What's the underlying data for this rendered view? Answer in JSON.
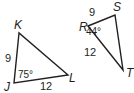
{
  "diagram": {
    "line_color": "#231f20",
    "triangles": [
      {
        "name": "JKL",
        "vertices": {
          "K": {
            "label": "K",
            "x": 19,
            "y": 33
          },
          "J": {
            "label": "J",
            "x": 14,
            "y": 83
          },
          "L": {
            "label": "L",
            "x": 68,
            "y": 75
          }
        },
        "sides": {
          "JK": "9",
          "JL": "12"
        },
        "angle": {
          "vertex": "J",
          "value": "75°"
        }
      },
      {
        "name": "RST",
        "vertices": {
          "R": {
            "label": "R",
            "x": 88,
            "y": 26
          },
          "S": {
            "label": "S",
            "x": 115,
            "y": 15
          },
          "T": {
            "label": "T",
            "x": 123,
            "y": 70
          }
        },
        "sides": {
          "RS": "9",
          "RT": "12"
        },
        "angle": {
          "vertex": "R",
          "value": "44°"
        }
      }
    ]
  }
}
